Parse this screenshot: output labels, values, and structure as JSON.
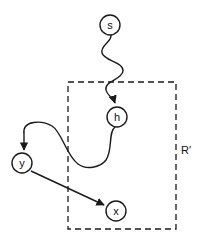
{
  "diagram": {
    "colors": {
      "stroke": "#1a1a1a",
      "background": "#ffffff"
    },
    "region": {
      "label": "R′",
      "style": "dashed"
    },
    "nodes": [
      {
        "id": "s",
        "label": "s"
      },
      {
        "id": "h",
        "label": "h"
      },
      {
        "id": "y",
        "label": "y"
      },
      {
        "id": "x",
        "label": "x"
      }
    ],
    "edges": [
      {
        "from": "s",
        "to": "h",
        "style": "wavy"
      },
      {
        "from": "h",
        "to": "y",
        "style": "curved"
      },
      {
        "from": "y",
        "to": "x",
        "style": "straight"
      }
    ]
  }
}
